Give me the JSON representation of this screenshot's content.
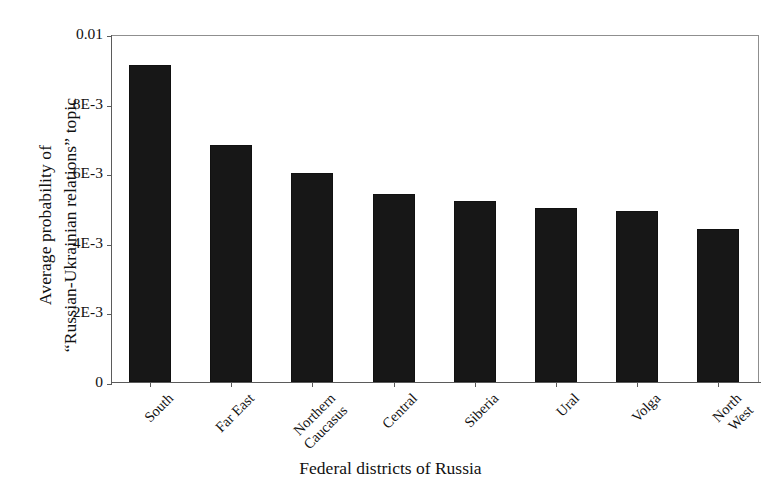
{
  "chart_data": {
    "type": "bar",
    "title": "",
    "xlabel": "Federal districts of Russia",
    "ylabel": "Average probability of “Russian-Ukrainian relations” topic",
    "ylabel_lines": [
      "Average probability of",
      "“Russian-Ukrainian relations” topic"
    ],
    "categories": [
      "South",
      "Far East",
      "Northern Caucasus",
      "Central",
      "Siberia",
      "Ural",
      "Volga",
      "North West"
    ],
    "category_lines": [
      [
        "South"
      ],
      [
        "Far East"
      ],
      [
        "Northern",
        "Caucasus"
      ],
      [
        "Central"
      ],
      [
        "Siberia"
      ],
      [
        "Ural"
      ],
      [
        "Volga"
      ],
      [
        "North",
        "West"
      ]
    ],
    "values": [
      0.0091,
      0.0068,
      0.006,
      0.0054,
      0.0052,
      0.005,
      0.0049,
      0.0044
    ],
    "ylim": [
      0,
      0.01
    ],
    "ytick_values": [
      0,
      0.002,
      0.004,
      0.006,
      0.008,
      0.01
    ],
    "ytick_labels": [
      "0",
      "2E-3",
      "4E-3",
      "6E-3",
      "8E-3",
      "0.01"
    ],
    "grid": false,
    "legend": null,
    "bar_color": "#171717",
    "axis_color": "#5b5b5b",
    "background_color": "#ffffff"
  }
}
